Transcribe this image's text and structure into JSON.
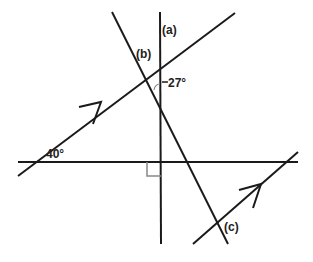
{
  "diagram": {
    "type": "geometry-angles",
    "line_color": "#1a1a1a",
    "marker_color": "#888888",
    "labels": {
      "a": "(a)",
      "b": "(b)",
      "c": "(c)",
      "angle_27": "27°",
      "angle_40": "40°"
    },
    "lines": [
      {
        "name": "upper-parallel-line",
        "from": [
          18,
          176
        ],
        "to": [
          235,
          13
        ],
        "arrow": true
      },
      {
        "name": "lower-parallel-line",
        "from": [
          193,
          244
        ],
        "to": [
          298,
          152
        ],
        "arrow": true
      },
      {
        "name": "horizontal-line",
        "from": [
          18,
          162
        ],
        "to": [
          298,
          162
        ]
      },
      {
        "name": "vertical-line",
        "from": [
          160,
          12
        ],
        "to": [
          161,
          244
        ]
      },
      {
        "name": "transversal-line",
        "from": [
          112,
          12
        ],
        "to": [
          228,
          244
        ]
      }
    ],
    "right_angle_marker": {
      "x": 147,
      "y": 162,
      "size": 14
    }
  }
}
